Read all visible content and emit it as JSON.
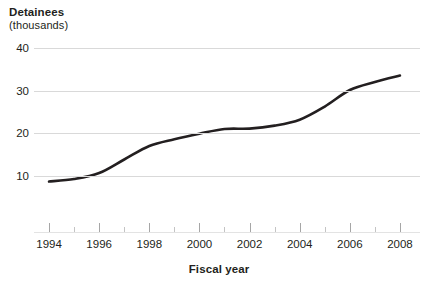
{
  "chart_data": {
    "type": "line",
    "title": "Detainees",
    "subtitle": "(thousands)",
    "ylabel": "Detainees (thousands)",
    "xlabel": "Fiscal year",
    "ylim": [
      0,
      42
    ],
    "xlim": [
      1993.4,
      2008.8
    ],
    "grid": true,
    "legend": "none",
    "y_ticks": [
      10,
      20,
      30,
      40
    ],
    "x_ticks_major": [
      1994,
      1996,
      1998,
      2000,
      2002,
      2004,
      2006,
      2008
    ],
    "x_ticks_minor": [
      1995,
      1997,
      1999,
      2001,
      2003,
      2005,
      2007
    ],
    "series": [
      {
        "name": "Detainees",
        "color": "#231f20",
        "x": [
          1994,
          1995,
          1996,
          1997,
          1998,
          1999,
          2000,
          2001,
          2002,
          2003,
          2004,
          2005,
          2006,
          2007,
          2008
        ],
        "values": [
          8.6,
          9.2,
          10.6,
          13.8,
          17.0,
          18.6,
          19.9,
          21.0,
          21.1,
          21.8,
          23.2,
          26.3,
          30.2,
          32.1,
          33.6
        ]
      }
    ]
  },
  "axis_titles": {
    "y_main": "Detainees",
    "y_sub": "(thousands)",
    "x_main": "Fiscal year"
  },
  "footnote": {
    "text": ""
  }
}
